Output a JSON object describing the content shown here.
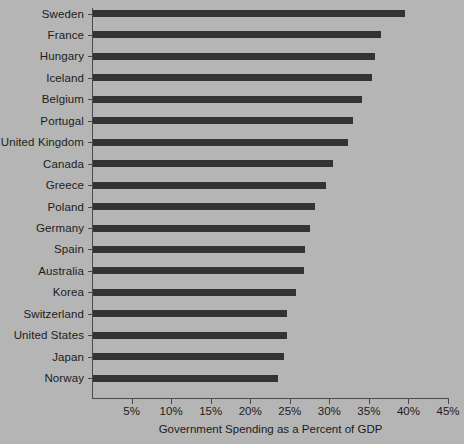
{
  "chart_data": {
    "type": "bar",
    "orientation": "horizontal",
    "title": "",
    "xlabel": "Government Spending as a Percent of GDP",
    "ylabel": "",
    "xlim": [
      0,
      45
    ],
    "xticks": [
      5,
      10,
      15,
      20,
      25,
      30,
      35,
      40,
      45
    ],
    "xtick_labels": [
      "5%",
      "10%",
      "15%",
      "20%",
      "25%",
      "30%",
      "35%",
      "40%",
      "45%"
    ],
    "grid": false,
    "legend": null,
    "bar_color": "#333333",
    "background_color": "#b5b5b5",
    "axis_color": "#4a4a4a",
    "text_color": "#1c1c1c",
    "categories": [
      "Sweden",
      "France",
      "Hungary",
      "Iceland",
      "Belgium",
      "Portugal",
      "United Kingdom",
      "Canada",
      "Greece",
      "Poland",
      "Germany",
      "Spain",
      "Australia",
      "Korea",
      "Switzerland",
      "United States",
      "Japan",
      "Norway"
    ],
    "values": [
      39.6,
      36.5,
      35.8,
      35.4,
      34.1,
      33.0,
      32.4,
      30.5,
      29.6,
      28.2,
      27.6,
      26.9,
      26.8,
      25.8,
      24.7,
      24.6,
      24.3,
      23.5
    ]
  }
}
